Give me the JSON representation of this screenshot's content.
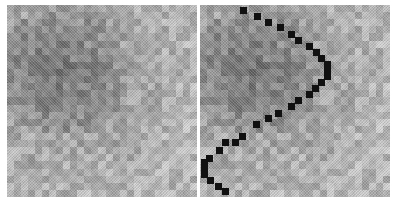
{
  "figure": {
    "grid_size": 27,
    "left_panel": {
      "label": ""
    },
    "right_panel": {
      "label": ""
    }
  },
  "path_points_right_panel": [
    [
      43,
      5
    ],
    [
      57,
      11
    ],
    [
      68,
      17
    ],
    [
      80,
      22
    ],
    [
      91,
      29
    ],
    [
      98,
      35
    ],
    [
      109,
      41
    ],
    [
      116,
      47
    ],
    [
      121,
      53
    ],
    [
      127,
      59
    ],
    [
      127,
      65
    ],
    [
      127,
      71
    ],
    [
      121,
      77
    ],
    [
      115,
      83
    ],
    [
      109,
      89
    ],
    [
      98,
      95
    ],
    [
      91,
      101
    ],
    [
      78,
      108
    ],
    [
      68,
      113
    ],
    [
      56,
      119
    ],
    [
      42,
      131
    ],
    [
      35,
      137
    ],
    [
      25,
      137
    ],
    [
      19,
      145
    ],
    [
      9,
      153
    ],
    [
      4,
      157
    ],
    [
      4,
      163
    ],
    [
      4,
      169
    ],
    [
      10,
      175
    ],
    [
      18,
      181
    ],
    [
      25,
      186
    ]
  ],
  "colors": {
    "path": "#111111",
    "background": "#ffffff"
  }
}
